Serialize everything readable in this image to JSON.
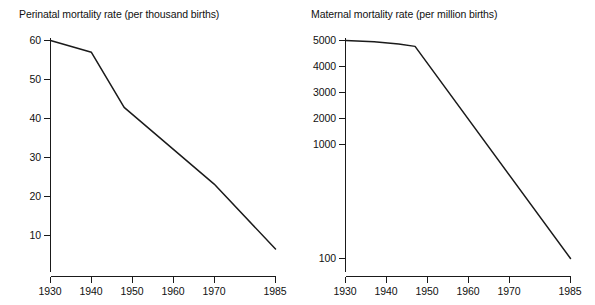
{
  "figure": {
    "background_color": "#ffffff",
    "line_color": "#1a1a1a",
    "text_color": "#111111"
  },
  "panels": {
    "left": {
      "title": "Perinatal mortality rate (per thousand births)",
      "y_ticks": [
        "60",
        "50",
        "40",
        "30",
        "20",
        "10"
      ],
      "x_ticks": [
        "1930",
        "1940",
        "1950",
        "1960",
        "1970",
        "1985"
      ]
    },
    "right": {
      "title": "Maternal mortality rate (per million births)",
      "y_ticks": [
        "5000",
        "4000",
        "3000",
        "2000",
        "1000",
        "100"
      ],
      "x_ticks": [
        "1930",
        "1940",
        "1950",
        "1960",
        "1970",
        "1985"
      ]
    }
  },
  "chart_data": [
    {
      "type": "line",
      "title": "Perinatal mortality rate (per thousand births)",
      "xlabel": "",
      "ylabel": "Perinatal mortality rate (per thousand births)",
      "yscale": "linear",
      "ylim": [
        0,
        62
      ],
      "xlim": [
        1930,
        1985
      ],
      "ytick_values": [
        60,
        50,
        40,
        30,
        20,
        10
      ],
      "ytick_labels": [
        "60",
        "50",
        "40",
        "30",
        "20",
        "10"
      ],
      "xtick_values": [
        1930,
        1940,
        1950,
        1960,
        1970,
        1985
      ],
      "xtick_labels": [
        "1930",
        "1940",
        "1950",
        "1960",
        "1970",
        "1985"
      ],
      "grid": false,
      "legend": false,
      "x": [
        1930,
        1940,
        1948,
        1970,
        1985
      ],
      "values": [
        60,
        57,
        43,
        23.5,
        7
      ],
      "series": [
        {
          "name": "Perinatal mortality rate",
          "x": [
            1930,
            1940,
            1948,
            1970,
            1985
          ],
          "values": [
            60,
            57,
            43,
            23.5,
            7
          ]
        }
      ]
    },
    {
      "type": "line",
      "title": "Maternal mortality rate (per million births)",
      "xlabel": "",
      "ylabel": "Maternal mortality rate (per million births)",
      "yscale": "log",
      "ylim": [
        100,
        5000
      ],
      "xlim": [
        1930,
        1985
      ],
      "ytick_values": [
        5000,
        4000,
        3000,
        2000,
        1000,
        100
      ],
      "ytick_labels": [
        "5000",
        "4000",
        "3000",
        "2000",
        "1000",
        "100"
      ],
      "xtick_values": [
        1930,
        1940,
        1950,
        1960,
        1970,
        1985
      ],
      "xtick_labels": [
        "1930",
        "1940",
        "1950",
        "1960",
        "1970",
        "1985"
      ],
      "grid": false,
      "legend": false,
      "x": [
        1930,
        1937,
        1943,
        1947,
        1985
      ],
      "values": [
        5000,
        4900,
        4700,
        4500,
        100
      ],
      "series": [
        {
          "name": "Maternal mortality rate",
          "x": [
            1930,
            1937,
            1943,
            1947,
            1985
          ],
          "values": [
            5000,
            4900,
            4700,
            4500,
            100
          ]
        }
      ]
    }
  ]
}
